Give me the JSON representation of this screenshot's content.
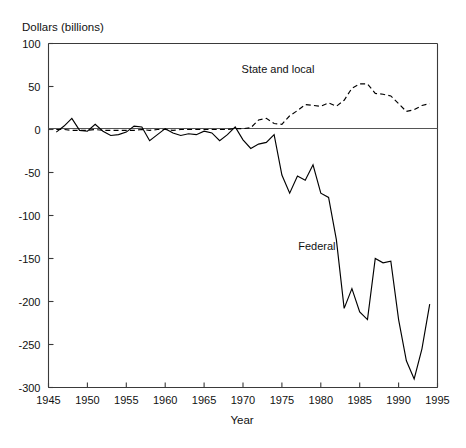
{
  "chart_data": {
    "type": "line",
    "title": "",
    "xlabel": "Year",
    "ylabel": "Dollars (billions)",
    "xlim": [
      1945,
      1995
    ],
    "ylim": [
      -300,
      100
    ],
    "xticks": [
      1945,
      1950,
      1955,
      1960,
      1965,
      1970,
      1975,
      1980,
      1985,
      1990,
      1995
    ],
    "yticks": [
      100,
      50,
      0,
      -50,
      -100,
      -150,
      -200,
      -250,
      -300
    ],
    "xtick_labels": [
      "1945",
      "1950",
      "1955",
      "1960",
      "1965",
      "1970",
      "1975",
      "1980",
      "1985",
      "1990",
      "1995"
    ],
    "ytick_labels": [
      "100",
      "50",
      "0",
      "-50",
      "-100",
      "-150",
      "-200",
      "-250",
      "-300"
    ],
    "grid": false,
    "legend_position": "inline-annotations",
    "zero_line": true,
    "series": [
      {
        "name": "Federal",
        "style": "solid",
        "color": "#000000",
        "label_x": 1979.5,
        "label_y": -140,
        "x": [
          1946,
          1947,
          1948,
          1949,
          1950,
          1951,
          1952,
          1953,
          1954,
          1955,
          1956,
          1957,
          1958,
          1959,
          1960,
          1961,
          1962,
          1963,
          1964,
          1965,
          1966,
          1967,
          1968,
          1969,
          1970,
          1971,
          1972,
          1973,
          1974,
          1975,
          1976,
          1977,
          1978,
          1979,
          1980,
          1981,
          1982,
          1983,
          1984,
          1985,
          1986,
          1987,
          1988,
          1989,
          1990,
          1991,
          1992,
          1993,
          1994
        ],
        "y": [
          -3,
          4,
          13,
          -1,
          -2,
          6,
          -2,
          -7,
          -6,
          -3,
          4,
          3,
          -13,
          -6,
          1,
          -4,
          -7,
          -5,
          -6,
          -2,
          -4,
          -13,
          -6,
          3,
          -12,
          -22,
          -17,
          -15,
          -6,
          -53,
          -74,
          -54,
          -59,
          -41,
          -74,
          -79,
          -128,
          -208,
          -185,
          -212,
          -221,
          -150,
          -155,
          -153,
          -221,
          -269,
          -290,
          -255,
          -203
        ]
      },
      {
        "name": "State and local",
        "style": "dashed",
        "color": "#000000",
        "label_x": 1974.5,
        "label_y": 66,
        "x": [
          1946,
          1947,
          1948,
          1949,
          1950,
          1951,
          1952,
          1953,
          1954,
          1955,
          1956,
          1957,
          1958,
          1959,
          1960,
          1961,
          1962,
          1963,
          1964,
          1965,
          1966,
          1967,
          1968,
          1969,
          1970,
          1971,
          1972,
          1973,
          1974,
          1975,
          1976,
          1977,
          1978,
          1979,
          1980,
          1981,
          1982,
          1983,
          1984,
          1985,
          1986,
          1987,
          1988,
          1989,
          1990,
          1991,
          1992,
          1993,
          1994
        ],
        "y": [
          0,
          0,
          -1,
          -1,
          -1,
          0,
          -1,
          -1,
          -1,
          -1,
          -1,
          0,
          -1,
          0,
          0,
          -1,
          0,
          0,
          0,
          0,
          0,
          0,
          0,
          1,
          1,
          2,
          11,
          13,
          7,
          6,
          16,
          22,
          29,
          28,
          27,
          31,
          27,
          34,
          48,
          53,
          53,
          42,
          41,
          39,
          30,
          21,
          23,
          28,
          30
        ]
      }
    ]
  }
}
